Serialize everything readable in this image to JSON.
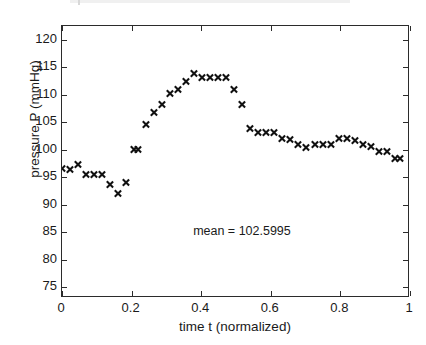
{
  "figure": {
    "background_color": "#ffffff",
    "axis_color": "#2b2b2b",
    "marker_color": "#111111",
    "annotation": "mean = 102.5995",
    "annotation_position": {
      "x": 0.52,
      "y": 85.0
    }
  },
  "chart_data": {
    "type": "scatter",
    "title": "",
    "xlabel": "time t (normalized)",
    "ylabel": "pressure P (mmHg)",
    "xlim": [
      0,
      1
    ],
    "ylim": [
      73,
      122.5
    ],
    "xticks": [
      0,
      0.2,
      0.4,
      0.6,
      0.8,
      1
    ],
    "xticklabels": [
      "0",
      "0.2",
      "0.4",
      "0.6",
      "0.8",
      "1"
    ],
    "yticks": [
      75,
      80,
      85,
      90,
      95,
      100,
      105,
      110,
      115,
      120
    ],
    "yticklabels": [
      "75",
      "80",
      "85",
      "90",
      "95",
      "100",
      "105",
      "110",
      "115",
      "120"
    ],
    "grid": false,
    "legend": null,
    "marker": "x",
    "mean": 102.5995,
    "series": [
      {
        "name": "pressure P",
        "x": [
          0.0,
          0.023,
          0.046,
          0.069,
          0.092,
          0.115,
          0.138,
          0.161,
          0.184,
          0.207,
          0.219,
          0.242,
          0.265,
          0.288,
          0.311,
          0.334,
          0.357,
          0.38,
          0.403,
          0.426,
          0.449,
          0.472,
          0.495,
          0.518,
          0.541,
          0.564,
          0.587,
          0.61,
          0.633,
          0.656,
          0.679,
          0.702,
          0.725,
          0.748,
          0.771,
          0.794,
          0.817,
          0.84,
          0.863,
          0.886,
          0.909,
          0.932,
          0.955,
          0.972
        ],
        "y": [
          96.6,
          96.3,
          97.3,
          95.5,
          95.5,
          95.5,
          93.6,
          92.1,
          94.0,
          100.0,
          100.0,
          104.5,
          106.8,
          108.3,
          110.2,
          111.0,
          112.4,
          113.9,
          113.1,
          113.1,
          113.1,
          113.1,
          111.0,
          108.2,
          103.8,
          103.1,
          103.1,
          103.1,
          102.1,
          101.8,
          101.0,
          100.3,
          101.0,
          101.0,
          101.0,
          102.1,
          102.1,
          101.6,
          101.0,
          100.6,
          99.7,
          99.6,
          98.3,
          98.3
        ]
      }
    ]
  }
}
